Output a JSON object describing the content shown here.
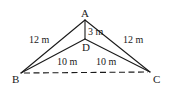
{
  "diagram": {
    "type": "geometry-figure",
    "stroke_color": "#1a1a1a",
    "background": "#ffffff",
    "points": {
      "A": {
        "label": "A",
        "x": 85,
        "y": 20
      },
      "B": {
        "label": "B",
        "x": 21,
        "y": 73
      },
      "C": {
        "label": "C",
        "x": 150,
        "y": 72
      },
      "D": {
        "label": "D",
        "x": 85,
        "y": 39
      }
    },
    "segments": [
      {
        "from": "A",
        "to": "B",
        "length": "12 m",
        "style": "solid"
      },
      {
        "from": "A",
        "to": "C",
        "length": "12 m",
        "style": "solid"
      },
      {
        "from": "A",
        "to": "D",
        "length": "3 m",
        "style": "solid"
      },
      {
        "from": "D",
        "to": "B",
        "length": "10 m",
        "style": "solid"
      },
      {
        "from": "D",
        "to": "C",
        "length": "10 m",
        "style": "solid"
      },
      {
        "from": "B",
        "to": "C",
        "length": "",
        "style": "dashed"
      }
    ],
    "labels": {
      "A": "A",
      "B": "B",
      "C": "C",
      "D": "D",
      "AB": "12 m",
      "AC": "12 m",
      "AD": "3 m",
      "DB": "10 m",
      "DC": "10 m"
    }
  }
}
